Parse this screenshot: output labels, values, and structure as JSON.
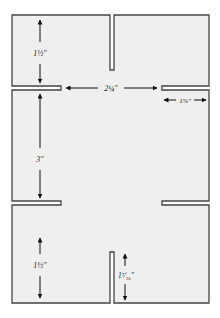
{
  "diagram": {
    "type": "cut-and-slot template",
    "colors": {
      "paper": "#efefef",
      "outline": "#444444",
      "dimension": "#111111"
    },
    "dimensions": {
      "top_panel_height": "1½\"",
      "slot_gap_width": "2¼\"",
      "side_slot_length": "1⅞\"",
      "middle_panel_height": "3\"",
      "bottom_panel_height": "1½\"",
      "bottom_slot_length": "1⁷⁄₁₆\""
    }
  }
}
